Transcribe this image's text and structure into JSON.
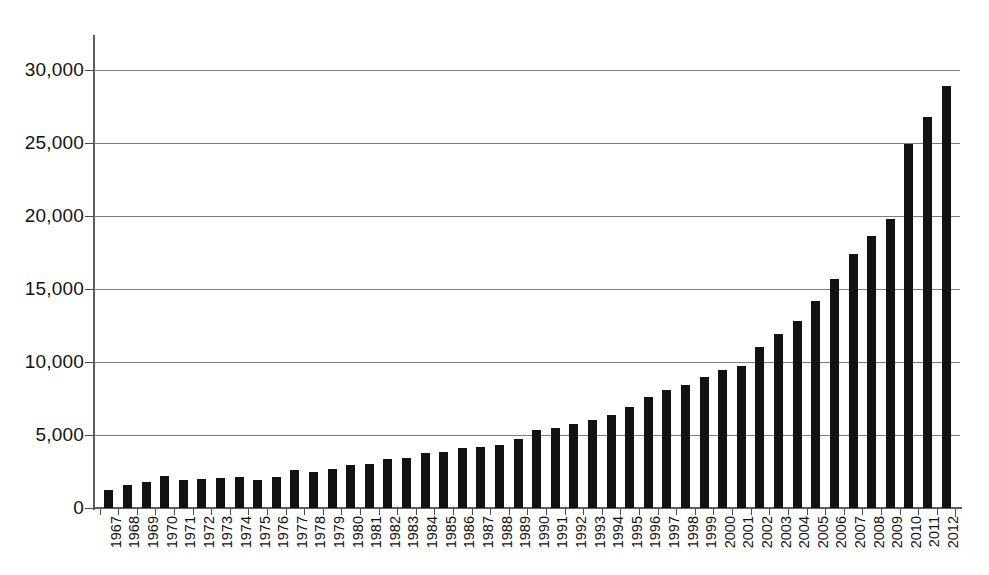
{
  "chart_data": {
    "type": "bar",
    "title": "",
    "subtitle": "",
    "xlabel": "",
    "ylabel": "",
    "ylim": [
      0,
      30000
    ],
    "yticks": [
      0,
      5000,
      10000,
      15000,
      20000,
      25000,
      30000
    ],
    "ytick_labels": [
      "0",
      "5,000",
      "10,000",
      "15,000",
      "20,000",
      "25,000",
      "30,000"
    ],
    "grid": true,
    "grid_axis": "y",
    "legend": false,
    "legend_position": "none",
    "bar_color": "#121212",
    "gridline_color": "#7c7c7c",
    "axis_color": "#5d5d5d",
    "background_color": "#ffffff",
    "categories": [
      "1967",
      "1968",
      "1969",
      "1970",
      "1971",
      "1972",
      "1973",
      "1974",
      "1975",
      "1976",
      "1977",
      "1978",
      "1979",
      "1980",
      "1981",
      "1982",
      "1983",
      "1984",
      "1985",
      "1986",
      "1987",
      "1988",
      "1989",
      "1990",
      "1991",
      "1992",
      "1993",
      "1994",
      "1995",
      "1996",
      "1997",
      "1998",
      "1999",
      "2000",
      "2001",
      "2002",
      "2003",
      "2004",
      "2005",
      "2006",
      "2007",
      "2008",
      "2009",
      "2010",
      "2011",
      "2012"
    ],
    "values": [
      1200,
      1600,
      1800,
      2200,
      1950,
      2000,
      2050,
      2150,
      1950,
      2150,
      2600,
      2500,
      2700,
      2950,
      3000,
      3350,
      3450,
      3750,
      3850,
      4100,
      4200,
      4300,
      4700,
      5350,
      5450,
      5750,
      6050,
      6400,
      6950,
      7600,
      8050,
      8400,
      8950,
      9450,
      9750,
      11050,
      11900,
      12800,
      14150,
      15700,
      17400,
      18600,
      19800,
      21300,
      22600,
      24900
    ],
    "values_extra": {
      "2010": 24900,
      "2011": 26800,
      "2012": 28900
    }
  }
}
